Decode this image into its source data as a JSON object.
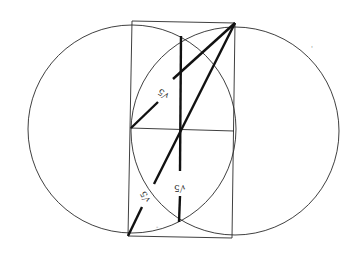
{
  "diagram": {
    "colors": {
      "background": "#ffffff",
      "stroke": "#2a2a2a",
      "thick_stroke": "#111111"
    },
    "labels": [
      {
        "id": "upper-diagonal-label",
        "text": "√5",
        "x": 158,
        "y": 89,
        "rotate": 215
      },
      {
        "id": "lower-diagonal-label",
        "text": "√5",
        "x": 140,
        "y": 192,
        "rotate": 240
      },
      {
        "id": "vertical-segment-label",
        "text": "√5",
        "x": 174,
        "y": 183,
        "rotate": 180
      }
    ],
    "marks": [
      {
        "id": "small-tick-bottom",
        "text": "-",
        "x": 158,
        "y": 227
      },
      {
        "id": "small-tick-right",
        "text": "'",
        "x": 312,
        "y": 48
      }
    ]
  }
}
